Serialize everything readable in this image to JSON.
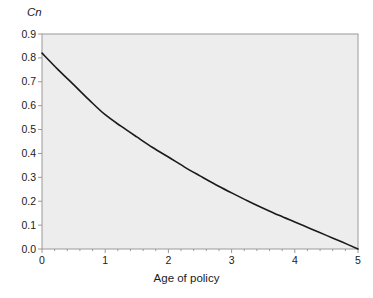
{
  "chart_data": {
    "type": "line",
    "title": "",
    "xlabel": "Age of policy",
    "ylabel": "Cn",
    "xlim": [
      0,
      5
    ],
    "ylim": [
      0,
      0.9
    ],
    "grid": false,
    "legend": null,
    "x_ticks": [
      "0",
      "1",
      "2",
      "3",
      "4",
      "5"
    ],
    "y_ticks": [
      "0.0",
      "0.1",
      "0.2",
      "0.3",
      "0.4",
      "0.5",
      "0.6",
      "0.7",
      "0.8",
      "0.9"
    ],
    "x_minor_ticks_per_interval": 5,
    "series": [
      {
        "name": "Cn",
        "x": [
          0,
          0.25,
          0.5,
          0.75,
          1,
          1.25,
          1.5,
          1.75,
          2,
          2.25,
          2.5,
          2.75,
          3,
          3.25,
          3.5,
          3.75,
          4,
          4.25,
          4.5,
          4.75,
          5
        ],
        "values": [
          0.82,
          0.752,
          0.688,
          0.623,
          0.562,
          0.514,
          0.469,
          0.425,
          0.385,
          0.344,
          0.306,
          0.269,
          0.235,
          0.202,
          0.171,
          0.141,
          0.113,
          0.085,
          0.057,
          0.029,
          0.0
        ]
      }
    ],
    "colors": {
      "plot_background": "#ededed",
      "plot_border": "#9a9a9a",
      "line": "#1a1a1a",
      "page_background": "#ffffff",
      "text": "#1a1a1a"
    }
  }
}
